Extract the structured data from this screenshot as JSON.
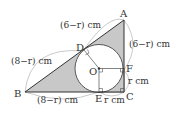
{
  "diagram": {
    "type": "geometry",
    "colors": {
      "shade": "#c8c8c8",
      "stroke": "#333333",
      "arc": "#bbbbbb",
      "circle_fill": "#ffffff"
    },
    "points": {
      "A": "A",
      "B": "B",
      "C": "C",
      "D": "D",
      "E": "E",
      "F": "F",
      "O": "O"
    },
    "measures": {
      "AD": "(6−r) cm",
      "AF": "(6−r) cm",
      "BD": "(8−r) cm",
      "BE": "(8−r) cm",
      "FC": "r cm",
      "EC": "r cm"
    }
  }
}
